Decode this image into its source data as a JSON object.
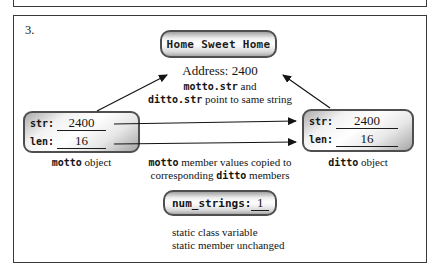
{
  "palette": {
    "ink": "#141414",
    "frame": "#3a3a3a",
    "box_border": "#4f4f4f",
    "box_fill_light": "#ffffff",
    "box_fill_dark": "#a6a6a6"
  },
  "figure": {
    "step_number": "3.",
    "string_box": {
      "text": "Home Sweet Home"
    },
    "address_note": {
      "text": "Address: 2400"
    },
    "pointer_note": {
      "code1": "motto.str",
      "text1": " and",
      "code2": "ditto.str",
      "text2": " point to same string"
    },
    "motto_box": {
      "rows": [
        {
          "label": "str:",
          "value": "2400"
        },
        {
          "label": "len:",
          "value": "16"
        }
      ],
      "caption_code": "motto",
      "caption_text": " object"
    },
    "ditto_box": {
      "rows": [
        {
          "label": "str:",
          "value": "2400"
        },
        {
          "label": "len:",
          "value": "16"
        }
      ],
      "caption_code": "ditto",
      "caption_text": " object"
    },
    "copy_note": {
      "code1": "motto",
      "text1": " member values copied to",
      "text2a": "corresponding ",
      "code2": "ditto",
      "text2b": " members"
    },
    "static_box": {
      "label": "num_strings:",
      "value": "1"
    },
    "static_note": {
      "line1": "static class variable",
      "line2": "static member unchanged"
    }
  }
}
